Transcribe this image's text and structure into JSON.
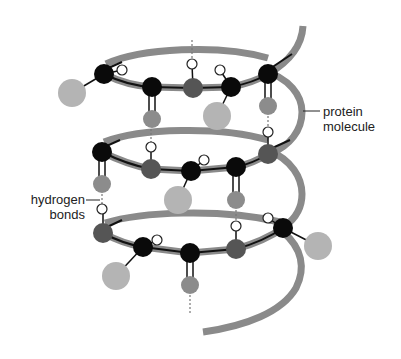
{
  "figure": {
    "colors": {
      "background": "#ffffff",
      "helix_ribbon": "#8a8a8a",
      "backbone_line": "#111111",
      "atom_black": "#0a0a0a",
      "atom_dark_gray": "#555555",
      "atom_mid_gray": "#8c8c8c",
      "atom_light_gray": "#b4b4b4",
      "atom_white": "#ffffff",
      "label_text": "#222222"
    },
    "legend_atoms": [
      {
        "name": "black-atom",
        "color": "#0a0a0a",
        "meaning": "backbone atom"
      },
      {
        "name": "dark-gray-atom",
        "color": "#555555",
        "meaning": "backbone atom"
      },
      {
        "name": "mid-gray-atom",
        "color": "#8c8c8c",
        "meaning": "carbonyl oxygen"
      },
      {
        "name": "light-gray-atom",
        "color": "#b4b4b4",
        "meaning": "side group"
      },
      {
        "name": "white-atom",
        "color": "#ffffff",
        "meaning": "hydrogen"
      }
    ]
  },
  "labels": {
    "protein_molecule": {
      "line1": "protein",
      "line2": "molecule"
    },
    "hydrogen_bonds": {
      "line1": "hydrogen",
      "line2": "bonds"
    }
  }
}
